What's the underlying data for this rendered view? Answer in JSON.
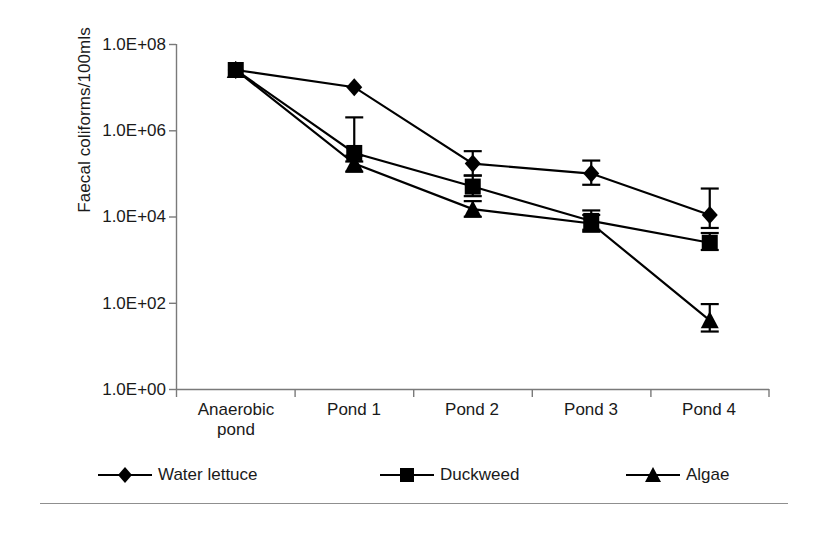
{
  "chart_data": {
    "type": "line",
    "title": "",
    "xlabel": "",
    "ylabel": "Faecal coliforms/100mls",
    "categories": [
      "Anaerobic pond",
      "Pond 1",
      "Pond 2",
      "Pond 3",
      "Pond 4"
    ],
    "category_lines": [
      [
        "Anaerobic",
        "pond"
      ],
      [
        "Pond 1",
        ""
      ],
      [
        "Pond 2",
        ""
      ],
      [
        "Pond 3",
        ""
      ],
      [
        "Pond 4",
        ""
      ]
    ],
    "yscale": "log",
    "ylim": [
      1,
      100000000
    ],
    "ytick_labels": [
      "1.0E+00",
      "1.0E+02",
      "1.0E+04",
      "1.0E+06",
      "1.0E+08"
    ],
    "ytick_values": [
      1,
      100,
      10000,
      1000000,
      100000000
    ],
    "grid": false,
    "legend_position": "bottom",
    "series": [
      {
        "name": "Water lettuce",
        "marker": "diamond",
        "color": "#000000",
        "values": [
          25000000,
          10000000,
          170000,
          100000,
          11000
        ],
        "err_low": [
          25000000,
          10000000,
          90000,
          55000,
          5500
        ],
        "err_high": [
          25000000,
          10000000,
          330000,
          200000,
          45000
        ]
      },
      {
        "name": "Duckweed",
        "marker": "square",
        "color": "#000000",
        "values": [
          25000000,
          300000,
          50000,
          8000,
          2500
        ],
        "err_low": [
          25000000,
          190000,
          30000,
          5000,
          1700
        ],
        "err_high": [
          25000000,
          2000000,
          90000,
          14000,
          4200
        ]
      },
      {
        "name": "Algae",
        "marker": "triangle",
        "color": "#000000",
        "values": [
          25000000,
          170000,
          15000,
          7000,
          40
        ],
        "err_low": [
          25000000,
          110000,
          10000,
          4500,
          22
        ],
        "err_high": [
          25000000,
          260000,
          23000,
          11000,
          95
        ]
      }
    ]
  },
  "axis": {
    "y_label": "Faecal coliforms/100mls",
    "ticks_y": [
      "1.0E+08",
      "1.0E+06",
      "1.0E+04",
      "1.0E+02",
      "1.0E+00"
    ],
    "ticks_x": [
      "Anaerobic",
      "pond",
      "Pond 1",
      "Pond 2",
      "Pond 3",
      "Pond 4"
    ]
  },
  "legend": {
    "items": [
      {
        "label": "Water lettuce",
        "marker": "diamond-marker-icon"
      },
      {
        "label": "Duckweed",
        "marker": "square-marker-icon"
      },
      {
        "label": "Algae",
        "marker": "triangle-marker-icon"
      }
    ]
  },
  "style": {
    "axis_color": "#7a7a7a",
    "series_color": "#000000",
    "background": "#ffffff",
    "rule_color": "#8f8f8f"
  }
}
